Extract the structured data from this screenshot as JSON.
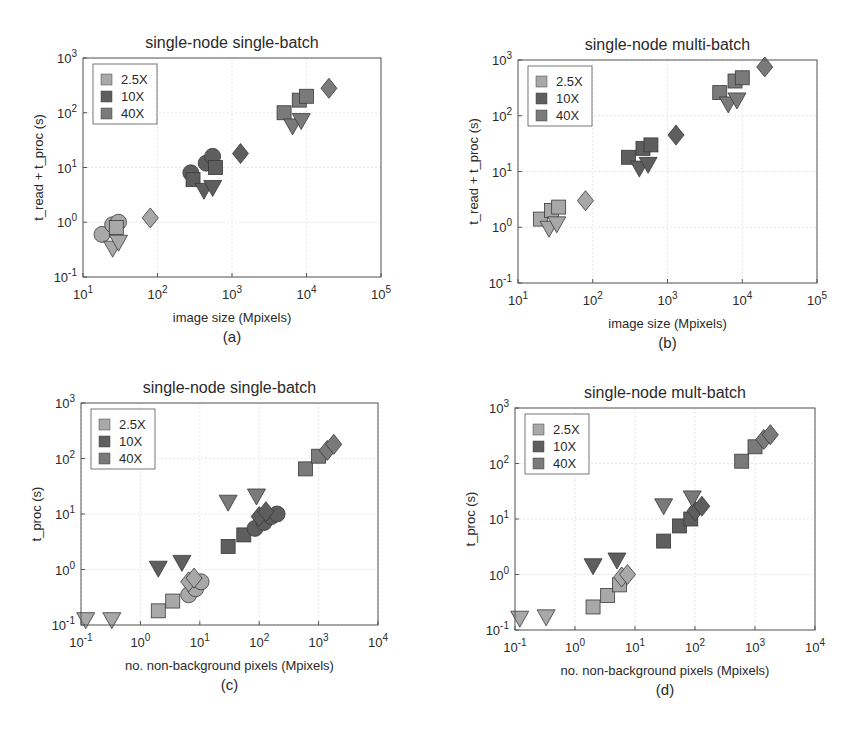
{
  "colors": {
    "c25": "#a8a8a8",
    "c10": "#5e5e5e",
    "c40": "#7a7a7a",
    "edge": "#3a3a3a",
    "axis": "#555555",
    "grid": "#dddddd"
  },
  "chart_data": [
    {
      "id": "a",
      "type": "scatter",
      "title": "single-node single-batch",
      "caption": "(a)",
      "xlabel": "image size (Mpixels)",
      "ylabel": "t_read + t_proc (s)",
      "xscale": "log",
      "yscale": "log",
      "xlim": [
        10,
        100000
      ],
      "ylim": [
        0.1,
        1000
      ],
      "xticks": [
        "10^1",
        "10^2",
        "10^3",
        "10^4",
        "10^5"
      ],
      "yticks": [
        "10^-1",
        "10^0",
        "10^1",
        "10^2",
        "10^3"
      ],
      "grid": true,
      "legend": {
        "position": "upper left",
        "entries": [
          "2.5X",
          "10X",
          "40X"
        ]
      },
      "box": [
        83,
        58,
        381,
        277
      ],
      "points": [
        {
          "x": 18,
          "y": 0.6,
          "m": "circle",
          "c": "c25"
        },
        {
          "x": 25,
          "y": 0.9,
          "m": "circle",
          "c": "c25"
        },
        {
          "x": 30,
          "y": 1.0,
          "m": "circle",
          "c": "c25"
        },
        {
          "x": 28,
          "y": 0.8,
          "m": "square",
          "c": "c25"
        },
        {
          "x": 25,
          "y": 0.35,
          "m": "triangle",
          "c": "c25"
        },
        {
          "x": 30,
          "y": 0.45,
          "m": "triangle",
          "c": "c25"
        },
        {
          "x": 80,
          "y": 1.2,
          "m": "diamond",
          "c": "c25"
        },
        {
          "x": 280,
          "y": 8,
          "m": "circle",
          "c": "c10"
        },
        {
          "x": 450,
          "y": 12,
          "m": "circle",
          "c": "c10"
        },
        {
          "x": 550,
          "y": 16,
          "m": "circle",
          "c": "c10"
        },
        {
          "x": 300,
          "y": 6,
          "m": "square",
          "c": "c10"
        },
        {
          "x": 600,
          "y": 10,
          "m": "square",
          "c": "c10"
        },
        {
          "x": 420,
          "y": 4,
          "m": "triangle",
          "c": "c10"
        },
        {
          "x": 550,
          "y": 4.5,
          "m": "triangle",
          "c": "c10"
        },
        {
          "x": 1300,
          "y": 18,
          "m": "diamond",
          "c": "c10"
        },
        {
          "x": 5000,
          "y": 100,
          "m": "square",
          "c": "c40"
        },
        {
          "x": 8000,
          "y": 170,
          "m": "square",
          "c": "c40"
        },
        {
          "x": 10000,
          "y": 200,
          "m": "square",
          "c": "c40"
        },
        {
          "x": 6500,
          "y": 60,
          "m": "triangle",
          "c": "c40"
        },
        {
          "x": 8500,
          "y": 75,
          "m": "triangle",
          "c": "c40"
        },
        {
          "x": 20000,
          "y": 280,
          "m": "diamond",
          "c": "c40"
        }
      ]
    },
    {
      "id": "b",
      "type": "scatter",
      "title": "single-node multi-batch",
      "caption": "(b)",
      "xlabel": "image size (Mpixels)",
      "ylabel": "t_read + t_proc (s)",
      "xscale": "log",
      "yscale": "log",
      "xlim": [
        10,
        100000
      ],
      "ylim": [
        0.1,
        1000
      ],
      "xticks": [
        "10^1",
        "10^2",
        "10^3",
        "10^4",
        "10^5"
      ],
      "yticks": [
        "10^-1",
        "10^0",
        "10^1",
        "10^2",
        "10^3"
      ],
      "grid": true,
      "legend": {
        "position": "upper left",
        "entries": [
          "2.5X",
          "10X",
          "40X"
        ]
      },
      "box": [
        518,
        60,
        817,
        283
      ],
      "points": [
        {
          "x": 20,
          "y": 1.4,
          "m": "square",
          "c": "c25"
        },
        {
          "x": 28,
          "y": 2.0,
          "m": "square",
          "c": "c25"
        },
        {
          "x": 35,
          "y": 2.3,
          "m": "square",
          "c": "c25"
        },
        {
          "x": 26,
          "y": 1.0,
          "m": "triangle",
          "c": "c25"
        },
        {
          "x": 33,
          "y": 1.2,
          "m": "triangle",
          "c": "c25"
        },
        {
          "x": 80,
          "y": 3.0,
          "m": "diamond",
          "c": "c25"
        },
        {
          "x": 300,
          "y": 18,
          "m": "square",
          "c": "c10"
        },
        {
          "x": 470,
          "y": 26,
          "m": "square",
          "c": "c10"
        },
        {
          "x": 600,
          "y": 30,
          "m": "square",
          "c": "c10"
        },
        {
          "x": 420,
          "y": 12,
          "m": "triangle",
          "c": "c10"
        },
        {
          "x": 550,
          "y": 14,
          "m": "triangle",
          "c": "c10"
        },
        {
          "x": 1300,
          "y": 45,
          "m": "diamond",
          "c": "c10"
        },
        {
          "x": 5000,
          "y": 260,
          "m": "square",
          "c": "c40"
        },
        {
          "x": 8000,
          "y": 420,
          "m": "square",
          "c": "c40"
        },
        {
          "x": 10000,
          "y": 480,
          "m": "square",
          "c": "c40"
        },
        {
          "x": 6500,
          "y": 170,
          "m": "triangle",
          "c": "c40"
        },
        {
          "x": 8500,
          "y": 200,
          "m": "triangle",
          "c": "c40"
        },
        {
          "x": 20000,
          "y": 750,
          "m": "diamond",
          "c": "c40"
        }
      ]
    },
    {
      "id": "c",
      "type": "scatter",
      "title": "single-node single-batch",
      "caption": "(c)",
      "xlabel": "no. non-background pixels (Mpixels)",
      "ylabel": "t_proc (s)",
      "xscale": "log",
      "yscale": "log",
      "xlim": [
        0.1,
        10000
      ],
      "ylim": [
        0.1,
        1000
      ],
      "xticks": [
        "10^-1",
        "10^0",
        "10^1",
        "10^2",
        "10^3",
        "10^4"
      ],
      "yticks": [
        "10^-1",
        "10^0",
        "10^1",
        "10^2",
        "10^3"
      ],
      "grid": true,
      "legend": {
        "position": "upper left",
        "entries": [
          "2.5X",
          "10X",
          "40X"
        ]
      },
      "box": [
        81,
        403,
        378,
        625
      ],
      "points": [
        {
          "x": 0.12,
          "y": 0.13,
          "m": "triangle",
          "c": "c25"
        },
        {
          "x": 0.33,
          "y": 0.13,
          "m": "triangle",
          "c": "c25"
        },
        {
          "x": 2.0,
          "y": 0.18,
          "m": "square",
          "c": "c25"
        },
        {
          "x": 3.5,
          "y": 0.27,
          "m": "square",
          "c": "c25"
        },
        {
          "x": 6.5,
          "y": 0.35,
          "m": "circle",
          "c": "c25"
        },
        {
          "x": 8.5,
          "y": 0.45,
          "m": "circle",
          "c": "c25"
        },
        {
          "x": 10.5,
          "y": 0.6,
          "m": "circle",
          "c": "c25"
        },
        {
          "x": 6.5,
          "y": 0.6,
          "m": "diamond",
          "c": "c25"
        },
        {
          "x": 8.0,
          "y": 0.7,
          "m": "diamond",
          "c": "c25"
        },
        {
          "x": 2.0,
          "y": 1.1,
          "m": "triangle",
          "c": "c10"
        },
        {
          "x": 5.0,
          "y": 1.4,
          "m": "triangle",
          "c": "c10"
        },
        {
          "x": 30,
          "y": 2.6,
          "m": "square",
          "c": "c10"
        },
        {
          "x": 55,
          "y": 4.2,
          "m": "square",
          "c": "c10"
        },
        {
          "x": 85,
          "y": 5.5,
          "m": "circle",
          "c": "c10"
        },
        {
          "x": 120,
          "y": 7,
          "m": "circle",
          "c": "c10"
        },
        {
          "x": 160,
          "y": 9,
          "m": "circle",
          "c": "c10"
        },
        {
          "x": 200,
          "y": 10,
          "m": "circle",
          "c": "c10"
        },
        {
          "x": 100,
          "y": 9,
          "m": "diamond",
          "c": "c10"
        },
        {
          "x": 130,
          "y": 11,
          "m": "diamond",
          "c": "c10"
        },
        {
          "x": 30,
          "y": 17,
          "m": "triangle",
          "c": "c40"
        },
        {
          "x": 90,
          "y": 22,
          "m": "triangle",
          "c": "c40"
        },
        {
          "x": 600,
          "y": 65,
          "m": "square",
          "c": "c40"
        },
        {
          "x": 1000,
          "y": 110,
          "m": "square",
          "c": "c40"
        },
        {
          "x": 1400,
          "y": 140,
          "m": "diamond",
          "c": "c40"
        },
        {
          "x": 1800,
          "y": 180,
          "m": "diamond",
          "c": "c40"
        }
      ]
    },
    {
      "id": "d",
      "type": "scatter",
      "title": "single-node mult-batch",
      "caption": "(d)",
      "xlabel": "no. non-background pixels (Mpixels)",
      "ylabel": "t_proc (s)",
      "xscale": "log",
      "yscale": "log",
      "xlim": [
        0.1,
        10000
      ],
      "ylim": [
        0.1,
        1000
      ],
      "xticks": [
        "10^-1",
        "10^0",
        "10^1",
        "10^2",
        "10^3",
        "10^4"
      ],
      "yticks": [
        "10^-1",
        "10^0",
        "10^1",
        "10^2",
        "10^3"
      ],
      "grid": true,
      "legend": {
        "position": "upper left",
        "entries": [
          "2.5X",
          "10X",
          "40X"
        ]
      },
      "box": [
        515,
        408,
        815,
        630
      ],
      "points": [
        {
          "x": 0.12,
          "y": 0.17,
          "m": "triangle",
          "c": "c25"
        },
        {
          "x": 0.33,
          "y": 0.18,
          "m": "triangle",
          "c": "c25"
        },
        {
          "x": 2.0,
          "y": 0.26,
          "m": "square",
          "c": "c25"
        },
        {
          "x": 3.5,
          "y": 0.42,
          "m": "square",
          "c": "c25"
        },
        {
          "x": 5.5,
          "y": 0.65,
          "m": "square",
          "c": "c25"
        },
        {
          "x": 6.0,
          "y": 0.9,
          "m": "diamond",
          "c": "c25"
        },
        {
          "x": 7.5,
          "y": 1.0,
          "m": "diamond",
          "c": "c25"
        },
        {
          "x": 2.0,
          "y": 1.5,
          "m": "triangle",
          "c": "c10"
        },
        {
          "x": 5.0,
          "y": 1.9,
          "m": "triangle",
          "c": "c10"
        },
        {
          "x": 30,
          "y": 4.0,
          "m": "square",
          "c": "c10"
        },
        {
          "x": 55,
          "y": 7.5,
          "m": "square",
          "c": "c10"
        },
        {
          "x": 85,
          "y": 10,
          "m": "square",
          "c": "c10"
        },
        {
          "x": 100,
          "y": 14,
          "m": "diamond",
          "c": "c10"
        },
        {
          "x": 130,
          "y": 17,
          "m": "diamond",
          "c": "c10"
        },
        {
          "x": 30,
          "y": 18,
          "m": "triangle",
          "c": "c40"
        },
        {
          "x": 90,
          "y": 25,
          "m": "triangle",
          "c": "c40"
        },
        {
          "x": 600,
          "y": 110,
          "m": "square",
          "c": "c40"
        },
        {
          "x": 1000,
          "y": 200,
          "m": "square",
          "c": "c40"
        },
        {
          "x": 1400,
          "y": 270,
          "m": "diamond",
          "c": "c40"
        },
        {
          "x": 1800,
          "y": 330,
          "m": "diamond",
          "c": "c40"
        }
      ]
    }
  ]
}
